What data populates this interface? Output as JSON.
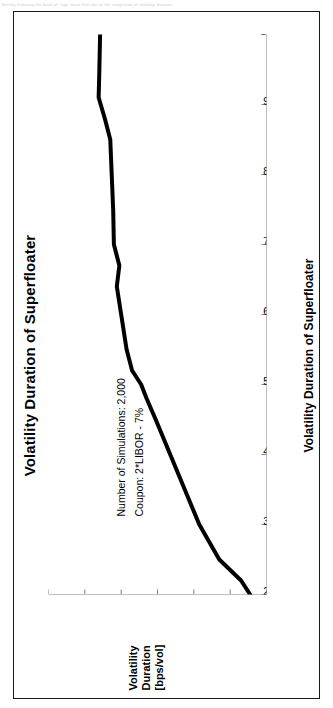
{
  "page": {
    "top_caption": "Survey featuring the bank of ~age since that one of the integration of volatility duration"
  },
  "figure": {
    "title": "Volatility Duration of Superfloater",
    "x_axis_title": "Volatility Duration of Superfloater",
    "y_axis_title_lines": [
      "Volatility",
      "Duration",
      "[bps/vol]"
    ],
    "annotations": [
      "Number of Simulations: 2,000",
      "Coupon: 2*LIBOR - 7%"
    ],
    "colors": {
      "line": "#000000",
      "axis": "#808080",
      "frame": "#1a1a1a",
      "background": "#ffffff"
    }
  },
  "chart_data": {
    "type": "line",
    "title": "Volatility Duration of Superfloater",
    "xlabel": "Volatility Duration of Superfloater",
    "ylabel": "Volatility Duration [bps/vol]",
    "xlim": [
      2.5,
      10.5
    ],
    "ylim": [
      -4,
      2
    ],
    "xticks": [
      2.5,
      3.5,
      4.5,
      5.5,
      6.5,
      7.5,
      8.5,
      9.5,
      10.5
    ],
    "xtick_labels": [
      "2.5",
      "3.5",
      "4.5",
      "5.5",
      "6.5",
      "7.5",
      "8.5",
      "9.5",
      "10.5"
    ],
    "yticks": [
      2,
      1,
      0,
      -1,
      -2,
      -3,
      -4
    ],
    "ytick_labels": [
      "2",
      "1",
      "0",
      "-1",
      "-2",
      "-3",
      "-4"
    ],
    "grid": false,
    "legend": "none",
    "series": [
      {
        "name": "Volatility Duration",
        "x": [
          2.5,
          2.7,
          3.0,
          3.5,
          4.0,
          4.5,
          5.0,
          5.3,
          5.5,
          5.7,
          6.0,
          6.5,
          6.9,
          7.2,
          7.5,
          8.0,
          8.5,
          9.0,
          9.3,
          9.6,
          10.0,
          10.5
        ],
        "y": [
          -3.55,
          -3.3,
          -2.7,
          -2.15,
          -1.75,
          -1.35,
          -0.95,
          -0.7,
          -0.55,
          -0.3,
          -0.15,
          0.0,
          0.12,
          0.05,
          0.2,
          0.22,
          0.26,
          0.3,
          0.45,
          0.62,
          0.6,
          0.58
        ]
      }
    ],
    "annotations": [
      {
        "text": "Number of Simulations: 2,000",
        "x": 4.2,
        "y": 1.25
      },
      {
        "text": "Coupon: 2*LIBOR - 7%",
        "x": 4.2,
        "y": 0.95
      }
    ]
  }
}
